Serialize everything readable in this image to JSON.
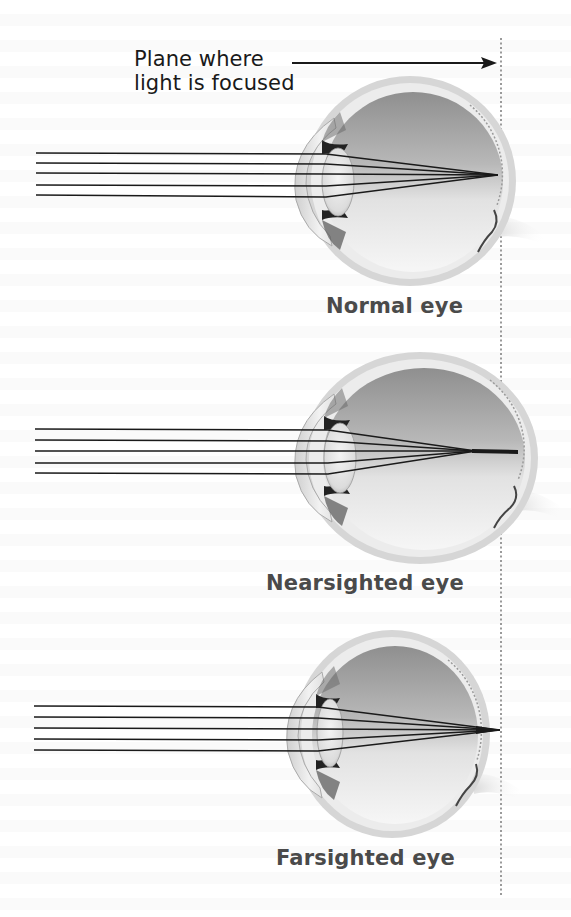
{
  "figure": {
    "callout": {
      "line1": "Plane where",
      "line2": "light is focused",
      "arrow": "right-arrow"
    },
    "focal_plane": {
      "style": "dotted-vertical-line",
      "x": 501
    },
    "colors": {
      "ray": "#1a1a1a",
      "label": "#4a4a4a",
      "sclera": "#d9d9d9",
      "vitreous_dark": "#8c8c8c",
      "vitreous_light": "#f2f2f2",
      "dotted_line": "#9a9a9a"
    },
    "panels": [
      {
        "id": "normal",
        "label": "Normal eye",
        "ray_count": 5,
        "focus": "on retina"
      },
      {
        "id": "nearsighted",
        "label": "Nearsighted eye",
        "ray_count": 5,
        "focus": "in front of retina"
      },
      {
        "id": "farsighted",
        "label": "Farsighted eye",
        "ray_count": 5,
        "focus": "behind retina"
      }
    ]
  }
}
